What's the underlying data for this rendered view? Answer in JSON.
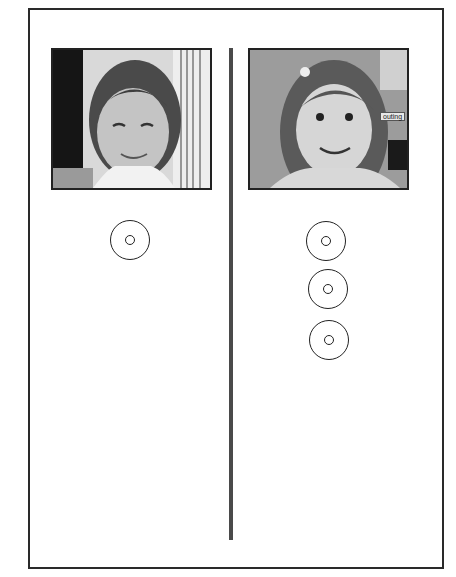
{
  "figure": {
    "panels": [
      {
        "id": "left",
        "photo": {
          "subject": "child-face-photo",
          "tone": "light-background"
        },
        "targets_count": 1
      },
      {
        "id": "right",
        "photo": {
          "subject": "child-face-photo",
          "sign_text": "outing"
        },
        "targets_count": 3
      }
    ],
    "colors": {
      "frame": "#2a2a2a",
      "divider": "#4a4a4a",
      "background": "#ffffff"
    }
  }
}
